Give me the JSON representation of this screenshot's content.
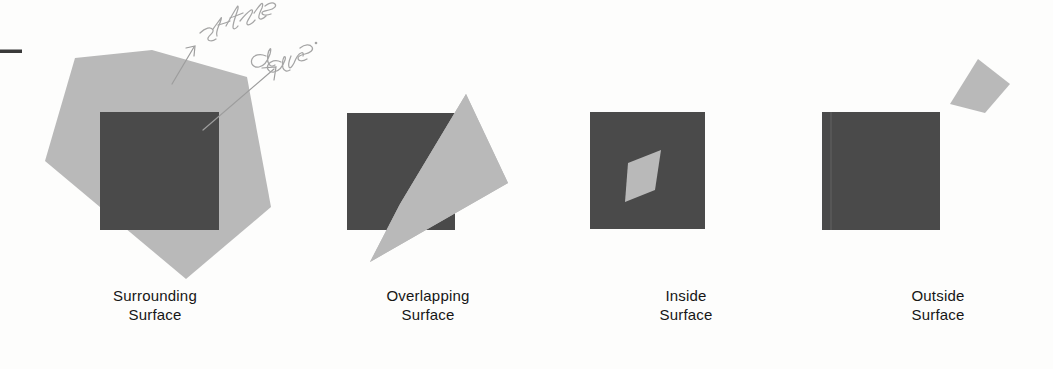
{
  "figure": {
    "background_color": "#fdfdfc",
    "dark_fill": "#4a4a4a",
    "light_fill": "#b9b9b9",
    "ink_color": "#9b9b9b",
    "margin_mark": {
      "name": "margin-dash",
      "color": "#3a3a3a"
    },
    "annotations": [
      {
        "text": "surface",
        "name": "handwriting-surface"
      },
      {
        "text": "area.",
        "name": "handwriting-area"
      }
    ],
    "panels": [
      {
        "id": "surrounding",
        "caption_line1": "Surrounding",
        "caption_line2": "Surface",
        "square_label": "dark-square",
        "overlay_label": "surrounding-polygon"
      },
      {
        "id": "overlapping",
        "caption_line1": "Overlapping",
        "caption_line2": "Surface",
        "square_label": "dark-square",
        "overlay_label": "overlapping-quad"
      },
      {
        "id": "inside",
        "caption_line1": "Inside",
        "caption_line2": "Surface",
        "square_label": "dark-square",
        "overlay_label": "inside-quad"
      },
      {
        "id": "outside",
        "caption_line1": "Outside",
        "caption_line2": "Surface",
        "square_label": "dark-square",
        "overlay_label": "outside-quad"
      }
    ]
  },
  "captions": {
    "surrounding": "Surrounding\nSurface",
    "overlapping": "Overlapping\nSurface",
    "inside": "Inside\nSurface",
    "outside": "Outside\nSurface"
  }
}
